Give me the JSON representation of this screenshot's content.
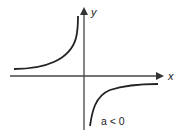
{
  "diagram": {
    "axes": {
      "x_label": "x",
      "y_label": "y"
    },
    "annotation": "a < 0",
    "curves": [
      {
        "name": "branch-second-quadrant",
        "quadrant": 2
      },
      {
        "name": "branch-fourth-quadrant",
        "quadrant": 4
      }
    ],
    "colors": {
      "axis": "#333333",
      "curve": "#222222",
      "text": "#222222",
      "background": "#ffffff"
    }
  }
}
